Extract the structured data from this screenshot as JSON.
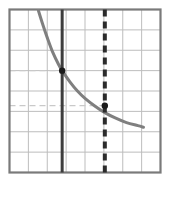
{
  "figure": {
    "title": "",
    "background_color": "#ffffff"
  },
  "chart_data": {
    "type": "line",
    "title": "",
    "subtitle": "",
    "xlabel": "",
    "ylabel": "",
    "xlim": [
      0,
      8
    ],
    "ylim": [
      0,
      8
    ],
    "grid": true,
    "grid_columns": 8,
    "grid_rows": 8,
    "grid_color": "#bdbdbd",
    "frame_color": "#7a7a7a",
    "legend": "none",
    "tick_labels_x": [],
    "tick_labels_y": [],
    "series": [
      {
        "name": "decreasing-curve",
        "type": "line",
        "color": "#7f7f7f",
        "style": "solid",
        "width": 3,
        "x": [
          1.53,
          1.75,
          2.0,
          2.3,
          2.6,
          2.79,
          3.2,
          3.6,
          4.0,
          4.5,
          5.05,
          5.6,
          6.2,
          6.8,
          7.1
        ],
        "y": [
          7.95,
          7.3,
          6.62,
          5.88,
          5.3,
          5.0,
          4.45,
          4.0,
          3.64,
          3.28,
          2.94,
          2.68,
          2.45,
          2.3,
          2.22
        ]
      }
    ],
    "vertical_lines": [
      {
        "name": "solid-vertical-line",
        "x": 2.79,
        "color": "#3d3d3d",
        "style": "solid",
        "width": 3
      },
      {
        "name": "dashed-vertical-line",
        "x": 5.05,
        "color": "#2b2b2b",
        "style": "dashed",
        "width": 4,
        "dash_pattern": "7,5"
      }
    ],
    "horizontal_guides": [
      {
        "name": "upper-guide",
        "y": 5.0,
        "x_from": 0,
        "x_to": 2.79,
        "color": "#c9c9c9",
        "style": "dashed"
      },
      {
        "name": "lower-guide",
        "y": 3.28,
        "x_from": 0,
        "x_to": 5.05,
        "color": "#c9c9c9",
        "style": "dashed"
      }
    ],
    "points": [
      {
        "name": "intersection-point-1",
        "x": 2.79,
        "y": 5.0,
        "color": "#1a1a1a",
        "radius": 3.2
      },
      {
        "name": "intersection-point-2",
        "x": 5.05,
        "y": 3.28,
        "color": "#1a1a1a",
        "radius": 3.2
      }
    ]
  }
}
